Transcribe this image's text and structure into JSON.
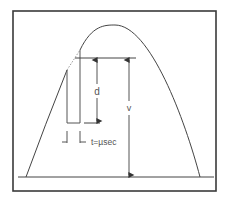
{
  "diagram": {
    "labels": {
      "d": "d",
      "v": "v",
      "t": "t=µsec"
    },
    "colors": {
      "frame": "#3a3a3a",
      "line": "#444444",
      "dotted_segment": "#9a9a9a",
      "text": "#555555",
      "background": "#ffffff"
    },
    "elements": {
      "frame": "rectangle border",
      "curve": "parabolic envelope",
      "pulse": "rectangular pulse under curve",
      "arrow_d": "double-headed vertical arrow labeled d",
      "arrow_v": "double-headed vertical arrow labeled v",
      "time_markers": "pulse width markers labeled t=µsec",
      "baseline": "horizontal baseline"
    }
  }
}
